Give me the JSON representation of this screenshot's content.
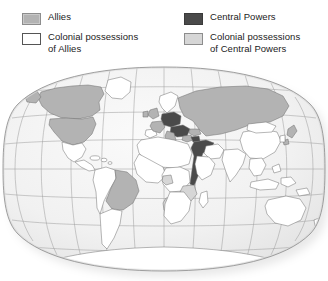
{
  "legend": {
    "columns": [
      {
        "items": [
          {
            "swatch": "allies-swatch",
            "color": "#b3b3b3",
            "label": "Allies"
          },
          {
            "swatch": "allies-colonial-swatch",
            "color": "#ffffff",
            "label": "Colonial possessions\nof Allies"
          }
        ]
      },
      {
        "items": [
          {
            "swatch": "central-powers-swatch",
            "color": "#4a4a4a",
            "label": "Central Powers"
          },
          {
            "swatch": "central-colonial-swatch",
            "color": "#d6d6d6",
            "label": "Colonial possessions\nof Central Powers"
          }
        ]
      }
    ]
  },
  "map": {
    "projection": "winkel-tripel",
    "ocean_color": "#f2f2f2",
    "graticule_color": "#9a9a9a",
    "border_color": "#6b6b6b",
    "outline_color": "#7a7a7a",
    "shadow_color": "#cfcfcf",
    "category_colors": {
      "allies": "#b3b3b3",
      "allies_colonial": "#ffffff",
      "central_powers": "#4a4a4a",
      "central_colonial": "#d6d6d6"
    },
    "regions": [
      {
        "name": "Canada",
        "category": "allies"
      },
      {
        "name": "United States",
        "category": "allies"
      },
      {
        "name": "Mexico",
        "category": "allies_colonial"
      },
      {
        "name": "Central America",
        "category": "allies_colonial"
      },
      {
        "name": "Caribbean",
        "category": "allies_colonial"
      },
      {
        "name": "Greenland",
        "category": "allies_colonial"
      },
      {
        "name": "Brazil",
        "category": "allies"
      },
      {
        "name": "Andean South America",
        "category": "allies_colonial"
      },
      {
        "name": "Argentina",
        "category": "allies_colonial"
      },
      {
        "name": "United Kingdom",
        "category": "allies"
      },
      {
        "name": "France",
        "category": "allies"
      },
      {
        "name": "Italy",
        "category": "allies"
      },
      {
        "name": "Russian Empire",
        "category": "allies"
      },
      {
        "name": "Serbia",
        "category": "allies"
      },
      {
        "name": "Romania",
        "category": "allies"
      },
      {
        "name": "Scandinavia",
        "category": "allies_colonial"
      },
      {
        "name": "Iberia",
        "category": "allies_colonial"
      },
      {
        "name": "German Empire",
        "category": "central_powers"
      },
      {
        "name": "Austria-Hungary",
        "category": "central_powers"
      },
      {
        "name": "Bulgaria",
        "category": "central_powers"
      },
      {
        "name": "Ottoman Empire",
        "category": "central_powers"
      },
      {
        "name": "North Africa",
        "category": "allies_colonial"
      },
      {
        "name": "West Africa",
        "category": "allies_colonial"
      },
      {
        "name": "Central Africa",
        "category": "allies_colonial"
      },
      {
        "name": "German East Africa",
        "category": "central_colonial"
      },
      {
        "name": "German South-West Africa",
        "category": "central_colonial"
      },
      {
        "name": "Kamerun",
        "category": "central_colonial"
      },
      {
        "name": "Southern Africa",
        "category": "allies_colonial"
      },
      {
        "name": "Madagascar",
        "category": "allies_colonial"
      },
      {
        "name": "Arabia",
        "category": "allies_colonial"
      },
      {
        "name": "Persia",
        "category": "allies_colonial"
      },
      {
        "name": "India",
        "category": "allies_colonial"
      },
      {
        "name": "China",
        "category": "allies_colonial"
      },
      {
        "name": "Mongolia",
        "category": "allies_colonial"
      },
      {
        "name": "Japan",
        "category": "allies"
      },
      {
        "name": "Southeast Asia",
        "category": "allies_colonial"
      },
      {
        "name": "Dutch East Indies",
        "category": "allies_colonial"
      },
      {
        "name": "Australia",
        "category": "allies_colonial"
      },
      {
        "name": "New Zealand",
        "category": "allies_colonial"
      },
      {
        "name": "Antarctica",
        "category": "allies_colonial"
      }
    ]
  }
}
